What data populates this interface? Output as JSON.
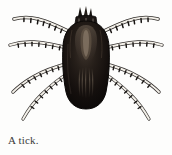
{
  "figure": {
    "subject": "tick",
    "illustration_style": "engraving",
    "colors": {
      "background": "#fdfdfc",
      "body_dark": "#120f0d",
      "body_mid": "#241d18",
      "body_highlight": "#6e5f52",
      "leg_outline": "#1a1a1a",
      "leg_fill": "#f2efe9",
      "caption_text": "#3b3b3b"
    },
    "parts": {
      "capitulum_label": "capitulum",
      "idiosoma_label": "idiosoma",
      "scutum_label": "scutum",
      "leg_count": 8,
      "legs_per_side": 4
    }
  },
  "caption": {
    "text": "A tick."
  }
}
